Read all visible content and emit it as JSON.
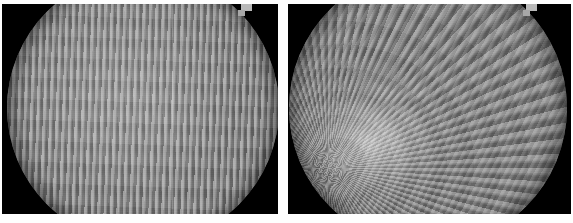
{
  "figure": {
    "type": "image-pair",
    "layout": "two side-by-side grayscale frames",
    "width_px": 573,
    "height_px": 223,
    "background_color": "#ffffff",
    "frame_background_color": "#000000",
    "alt": "Two grayscale interferogram frames, each a bright circular disc covered in wavy interference fringes on a black background."
  },
  "panels": [
    {
      "id": "left",
      "name": "left-frame",
      "caption": "",
      "frame": {
        "x": 2,
        "y": 4,
        "width": 276,
        "height": 210,
        "background": "#000000"
      },
      "disc": {
        "shape": "circle",
        "center_x": 143,
        "center_y": 108,
        "radius": 136,
        "cropped_top": true,
        "cropped_bottom": true,
        "mean_gray": "#8b8b8b",
        "rim_gray": "#565656",
        "highlight": {
          "x_pct": 42,
          "y_pct": 46,
          "intensity": 0.16
        }
      },
      "fringes": {
        "orientation": "near-vertical",
        "pattern": "wavy / serpentine",
        "spacing_px": 6.4,
        "count_approx": 40,
        "contrast": "low"
      },
      "artifacts": [
        {
          "type": "scan-line",
          "name": "vertical-scan-line",
          "x": 172,
          "color": "#ffffff",
          "opacity": 0.16
        },
        {
          "type": "notch",
          "name": "upper-right-notch",
          "x": 243,
          "y": 6
        }
      ]
    },
    {
      "id": "right",
      "name": "right-frame",
      "caption": "",
      "frame": {
        "x": 288,
        "y": 4,
        "width": 283,
        "height": 210,
        "background": "#000000"
      },
      "disc": {
        "shape": "circle",
        "center_x": 428,
        "center_y": 108,
        "radius": 139,
        "cropped_top": true,
        "cropped_bottom": true,
        "mean_gray": "#868686",
        "rim_gray": "#535353",
        "highlight": {
          "x_pct": 30,
          "y_pct": 62,
          "intensity": 0.5,
          "label": "bright focal spot"
        }
      },
      "fringes": {
        "orientation": "curved / radiating",
        "pattern": "concentric-warped",
        "spacing_px": 6.6,
        "count_approx": 42,
        "contrast": "low"
      },
      "artifacts": [
        {
          "type": "ridge",
          "name": "curved-ridge-arc",
          "x": 400,
          "y": 60,
          "description": "diagonal curved ridge across upper-left quadrant"
        },
        {
          "type": "notch",
          "name": "upper-right-notch",
          "x": 530,
          "y": 6
        }
      ]
    }
  ],
  "colors": {
    "page_background": "#ffffff",
    "frame_background": "#000000",
    "disc_mid_gray": "#8b8b8b",
    "disc_rim_gray": "#555555",
    "notch_gray": "#b9b9b9",
    "highlight_white": "#ffffff"
  }
}
